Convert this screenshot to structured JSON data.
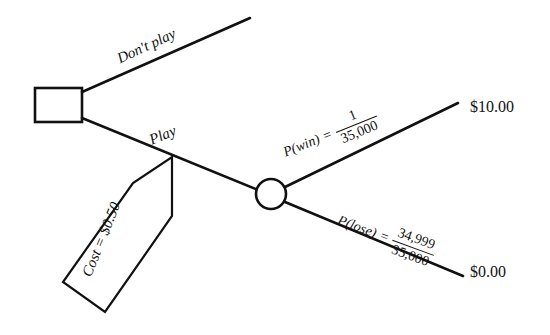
{
  "diagram": {
    "type": "decision-tree",
    "background_color": "#ffffff",
    "line_color": "#111111",
    "nodes": {
      "decision": {
        "shape": "square",
        "name": "decision-node",
        "x": 35,
        "y": 88,
        "width": 47,
        "height": 34
      },
      "chance": {
        "shape": "circle",
        "name": "chance-node",
        "cx": 271,
        "cy": 194,
        "r": 15
      }
    },
    "branches": {
      "dont_play": {
        "label": "Don't play",
        "from": [
          82,
          92
        ],
        "to": [
          250,
          18
        ]
      },
      "play": {
        "label": "Play",
        "from": [
          82,
          118
        ],
        "to": [
          257,
          190
        ]
      },
      "win": {
        "label_p": "P(win)",
        "equals": "=",
        "numerator": "1",
        "denominator": "35,000",
        "from": [
          286,
          188
        ],
        "to": [
          458,
          104
        ]
      },
      "lose": {
        "label_p": "P(lose)",
        "equals": "=",
        "numerator": "34,999",
        "denominator": "35,000",
        "from": [
          286,
          202
        ],
        "to": [
          462,
          276
        ]
      }
    },
    "payoffs": {
      "win": "$10.00",
      "lose": "$0.00"
    },
    "callout": {
      "text": "Cost = $0.50",
      "shape": "pentagon-banner",
      "tip": [
        172,
        157
      ]
    }
  }
}
